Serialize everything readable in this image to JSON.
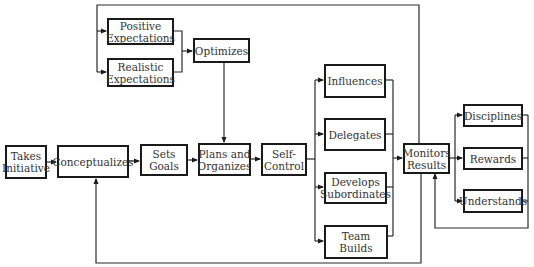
{
  "diagram": {
    "type": "flowchart",
    "nodes": {
      "takes_initiative": "Takes\nInitiative",
      "conceptualizes": "Conceptualizes",
      "sets_goals": "Sets Goals",
      "plans_and_organizes": "Plans and\nOrganizes",
      "self_control": "Self-\nControl",
      "positive_expectations": "Positive\nExpectations",
      "realistic_expectations": "Realistic\nExpectations",
      "optimizes": "Optimizes",
      "influences": "Influences",
      "delegates": "Delegates",
      "develops_subordinates": "Develops\nSubordinates",
      "team_builds": "Team\nBuilds",
      "monitors_results": "Monitors\nResults",
      "disciplines": "Disciplines",
      "rewards": "Rewards",
      "understands": "Understands"
    },
    "edges": [
      [
        "takes_initiative",
        "conceptualizes"
      ],
      [
        "conceptualizes",
        "sets_goals"
      ],
      [
        "sets_goals",
        "plans_and_organizes"
      ],
      [
        "plans_and_organizes",
        "self_control"
      ],
      [
        "monitors_results",
        "positive_expectations"
      ],
      [
        "monitors_results",
        "realistic_expectations"
      ],
      [
        "positive_expectations",
        "optimizes"
      ],
      [
        "realistic_expectations",
        "optimizes"
      ],
      [
        "optimizes",
        "plans_and_organizes"
      ],
      [
        "self_control",
        "influences"
      ],
      [
        "self_control",
        "delegates"
      ],
      [
        "self_control",
        "develops_subordinates"
      ],
      [
        "self_control",
        "team_builds"
      ],
      [
        "influences",
        "monitors_results"
      ],
      [
        "delegates",
        "monitors_results"
      ],
      [
        "develops_subordinates",
        "monitors_results"
      ],
      [
        "team_builds",
        "monitors_results"
      ],
      [
        "monitors_results",
        "disciplines"
      ],
      [
        "monitors_results",
        "rewards"
      ],
      [
        "monitors_results",
        "understands"
      ],
      [
        "disciplines",
        "monitors_results"
      ],
      [
        "rewards",
        "monitors_results"
      ],
      [
        "understands",
        "monitors_results"
      ],
      [
        "monitors_results",
        "conceptualizes"
      ]
    ]
  }
}
